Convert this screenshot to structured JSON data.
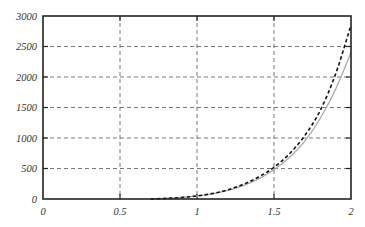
{
  "chart_data": {
    "type": "line",
    "title": "",
    "xlabel": "",
    "ylabel": "",
    "xlim": [
      0,
      2
    ],
    "ylim": [
      0,
      3000
    ],
    "grid": true,
    "legend": null,
    "x_ticks": [
      "0",
      "0.5",
      "1",
      "1.5",
      "2"
    ],
    "y_ticks": [
      "0",
      "500",
      "1000",
      "1500",
      "2000",
      "2500",
      "3000"
    ],
    "series": [
      {
        "name": "dashed",
        "style": "dashed",
        "color": "#111111",
        "x": [
          0.7,
          0.8,
          0.9,
          1.0,
          1.1,
          1.2,
          1.3,
          1.4,
          1.5,
          1.6,
          1.7,
          1.8,
          1.9,
          2.0
        ],
        "y": [
          0,
          10,
          25,
          50,
          90,
          150,
          240,
          360,
          520,
          740,
          1040,
          1450,
          2050,
          2850
        ]
      },
      {
        "name": "solid",
        "style": "solid",
        "color": "#aaaaaa",
        "x": [
          0.7,
          0.8,
          0.9,
          1.0,
          1.1,
          1.2,
          1.3,
          1.4,
          1.5,
          1.6,
          1.7,
          1.8,
          1.9,
          2.0
        ],
        "y": [
          0,
          10,
          25,
          50,
          85,
          140,
          220,
          330,
          480,
          680,
          950,
          1320,
          1800,
          2400
        ]
      }
    ]
  }
}
